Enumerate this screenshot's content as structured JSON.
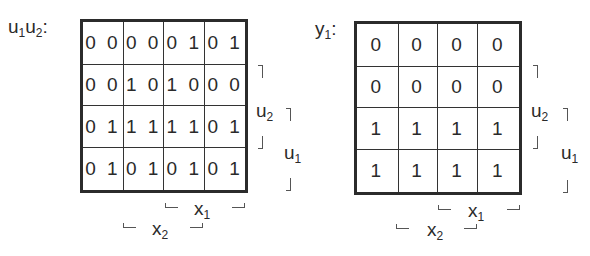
{
  "maps": [
    {
      "id": "u1u2",
      "title": "u",
      "title_parts": [
        "u",
        "1",
        "u",
        "2",
        ":"
      ],
      "cells": [
        [
          "0 0",
          "0 0",
          "0 1",
          "0 1"
        ],
        [
          "0 0",
          "1 0",
          "1 0",
          "0 0"
        ],
        [
          "0 1",
          "1 1",
          "1 1",
          "0 1"
        ],
        [
          "0 1",
          "0 1",
          "0 1",
          "0 1"
        ]
      ],
      "labels": {
        "right_inner": {
          "base": "u",
          "sub": "2"
        },
        "right_outer": {
          "base": "u",
          "sub": "1"
        },
        "bottom_inner": {
          "base": "x",
          "sub": "1"
        },
        "bottom_outer": {
          "base": "x",
          "sub": "2"
        }
      }
    },
    {
      "id": "y1",
      "title_parts": [
        "y",
        "1",
        ":"
      ],
      "cells": [
        [
          "0",
          "0",
          "0",
          "0"
        ],
        [
          "0",
          "0",
          "0",
          "0"
        ],
        [
          "1",
          "1",
          "1",
          "1"
        ],
        [
          "1",
          "1",
          "1",
          "1"
        ]
      ],
      "labels": {
        "right_inner": {
          "base": "u",
          "sub": "2"
        },
        "right_outer": {
          "base": "u",
          "sub": "1"
        },
        "bottom_inner": {
          "base": "x",
          "sub": "1"
        },
        "bottom_outer": {
          "base": "x",
          "sub": "2"
        }
      }
    }
  ]
}
